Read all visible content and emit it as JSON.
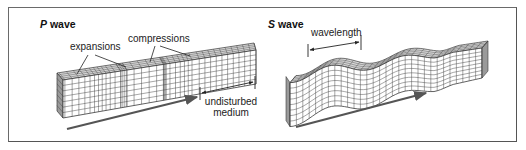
{
  "figure": {
    "panels": [
      {
        "id": "p-wave",
        "title_letter": "P",
        "title_word": "wave",
        "labels": {
          "expansions": "expansions",
          "compressions": "compressions",
          "undisturbed_line1": "undisturbed",
          "undisturbed_line2": "medium"
        }
      },
      {
        "id": "s-wave",
        "title_letter": "S",
        "title_word": "wave",
        "labels": {
          "wavelength": "wavelength"
        }
      }
    ],
    "colors": {
      "grid_line": "#3a3a3a",
      "top_face": "#d8d8d8",
      "front_face": "#ffffff",
      "end_face": "#9a9a9a",
      "arrow": "#555555",
      "frame": "#6a6a6a"
    }
  }
}
